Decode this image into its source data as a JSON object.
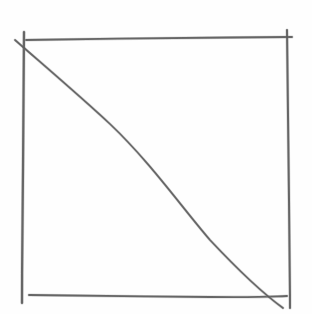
{
  "drawing": {
    "description": "Hand-drawn pencil sketch of a square with a diagonal line from top-left to bottom-right",
    "background_color": "#fefefe",
    "pencil_color": "#5a5a5a",
    "pencil_light_color": "#8a8a8a",
    "strokes": [
      {
        "name": "top-edge",
        "d": "M26,40 C90,39 170,38 230,37.5 S285,37 292,37",
        "width": 1.8
      },
      {
        "name": "left-edge",
        "d": "M24,32 C24,70 23.5,120 23,170 S22,260 22,303",
        "width": 2.2
      },
      {
        "name": "right-edge",
        "d": "M287,30 C288,80 288.5,140 289,200 S290,280 290,308",
        "width": 2.0
      },
      {
        "name": "bottom-edge",
        "d": "M29,295 C80,296 150,296.5 210,297 S270,296.5 287,296",
        "width": 1.8
      },
      {
        "name": "diagonal",
        "d": "M15,40 C40,62 80,96 110,124 C150,162 180,205 210,240 C240,272 265,295 283,308",
        "width": 1.7
      }
    ]
  }
}
